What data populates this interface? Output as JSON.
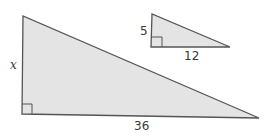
{
  "figure": {
    "fill_color": "#e4e4e4",
    "stroke_color": "#555555",
    "large_triangle": {
      "vertical_leg_label": "x",
      "horizontal_leg_label": "36",
      "right_angle_marker": true
    },
    "small_triangle": {
      "vertical_leg_label": "5",
      "horizontal_leg_label": "12",
      "right_angle_marker": true
    }
  }
}
